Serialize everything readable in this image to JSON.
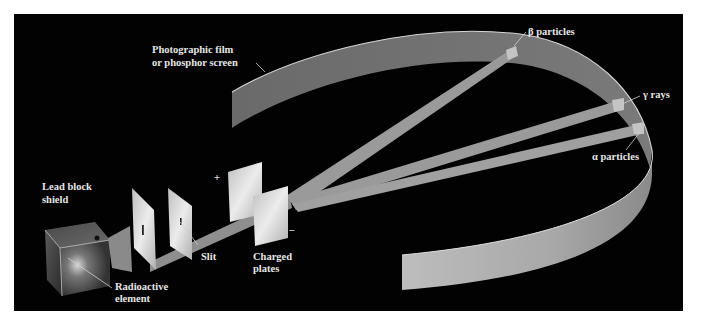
{
  "figure": {
    "background_color": "#000000",
    "page_color": "#ffffff"
  },
  "labels": {
    "film": {
      "line1": "Photographic film",
      "line2": "or phosphor screen"
    },
    "beta": "β particles",
    "gamma": "γ rays",
    "alpha": "α particles",
    "lead_block": {
      "line1": "Lead block",
      "line2": "shield"
    },
    "radioactive": {
      "line1": "Radioactive",
      "line2": "element"
    },
    "slit": "Slit",
    "charged_plates": {
      "line1": "Charged",
      "line2": "plates"
    },
    "plus_sign": "+",
    "minus_sign": "−"
  },
  "components": [
    {
      "id": "lead-block",
      "name": "Lead block shield"
    },
    {
      "id": "radioactive-element",
      "name": "Radioactive element"
    },
    {
      "id": "collimator-plate",
      "name": "Collimator plate"
    },
    {
      "id": "slit-plate",
      "name": "Slit"
    },
    {
      "id": "positive-plate",
      "name": "Positive charged plate",
      "charge": "+"
    },
    {
      "id": "negative-plate",
      "name": "Negative charged plate",
      "charge": "−"
    },
    {
      "id": "detector",
      "name": "Photographic film or phosphor screen"
    }
  ],
  "beams": [
    {
      "id": "beta",
      "label": "β particles",
      "deflection": "toward positive plate (strong)"
    },
    {
      "id": "gamma",
      "label": "γ rays",
      "deflection": "none"
    },
    {
      "id": "alpha",
      "label": "α particles",
      "deflection": "toward negative plate (weak)"
    }
  ],
  "colors": {
    "beam": "#9a9a9a",
    "film_inner": "#6e6e6e",
    "film_outer": "#b4b4b4",
    "plate": "#d8d8d8",
    "text": "#e6e6e6"
  }
}
